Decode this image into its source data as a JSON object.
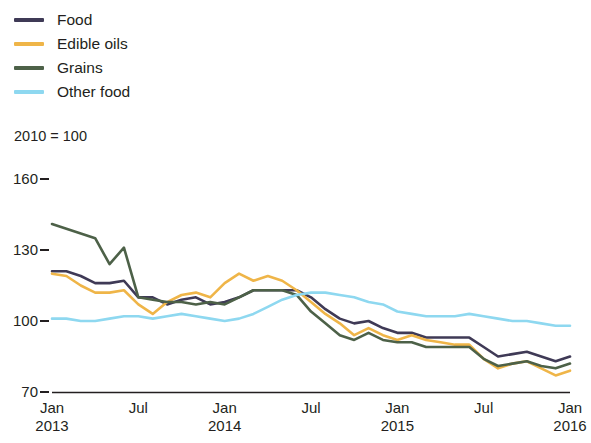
{
  "legend": {
    "items": [
      {
        "label": "Food",
        "color": "#3f3a56",
        "name": "legend-item-food"
      },
      {
        "label": "Edible oils",
        "color": "#efb548",
        "name": "legend-item-edible-oils"
      },
      {
        "label": "Grains",
        "color": "#4d6148",
        "name": "legend-item-grains"
      },
      {
        "label": "Other food",
        "color": "#8ed8f0",
        "name": "legend-item-other-food"
      }
    ]
  },
  "axis_note": "2010 = 100",
  "chart_data": {
    "type": "line",
    "title": "",
    "subtitle": "",
    "xlabel": "",
    "ylabel": "2010 = 100",
    "ylim": [
      70,
      160
    ],
    "yticks": [
      160,
      130,
      100,
      70
    ],
    "grid": false,
    "legend_position": "top-left",
    "x": [
      "Jan 2013",
      "Feb 2013",
      "Mar 2013",
      "Apr 2013",
      "May 2013",
      "Jun 2013",
      "Jul 2013",
      "Aug 2013",
      "Sep 2013",
      "Oct 2013",
      "Nov 2013",
      "Dec 2013",
      "Jan 2014",
      "Feb 2014",
      "Mar 2014",
      "Apr 2014",
      "May 2014",
      "Jun 2014",
      "Jul 2014",
      "Aug 2014",
      "Sep 2014",
      "Oct 2014",
      "Nov 2014",
      "Dec 2014",
      "Jan 2015",
      "Feb 2015",
      "Mar 2015",
      "Apr 2015",
      "May 2015",
      "Jun 2015",
      "Jul 2015",
      "Aug 2015",
      "Sep 2015",
      "Oct 2015",
      "Nov 2015",
      "Dec 2015",
      "Jan 2016"
    ],
    "xticks": [
      {
        "label": "Jan",
        "year": "2013",
        "index": 0
      },
      {
        "label": "Jul",
        "year": "",
        "index": 6
      },
      {
        "label": "Jan",
        "year": "2014",
        "index": 12
      },
      {
        "label": "Jul",
        "year": "",
        "index": 18
      },
      {
        "label": "Jan",
        "year": "2015",
        "index": 24
      },
      {
        "label": "Jul",
        "year": "",
        "index": 30
      },
      {
        "label": "Jan",
        "year": "2016",
        "index": 36
      }
    ],
    "series": [
      {
        "name": "Food",
        "color": "#3f3a56",
        "values": [
          121,
          121,
          119,
          116,
          116,
          117,
          110,
          110,
          107,
          109,
          110,
          107,
          108,
          110,
          113,
          113,
          113,
          113,
          110,
          105,
          101,
          99,
          100,
          97,
          95,
          95,
          93,
          93,
          93,
          93,
          89,
          85,
          86,
          87,
          85,
          83,
          85
        ]
      },
      {
        "name": "Edible oils",
        "color": "#efb548",
        "values": [
          120,
          119,
          115,
          112,
          112,
          113,
          107,
          103,
          108,
          111,
          112,
          110,
          116,
          120,
          117,
          119,
          117,
          113,
          108,
          103,
          99,
          94,
          97,
          94,
          92,
          94,
          92,
          91,
          90,
          90,
          84,
          80,
          82,
          83,
          80,
          77,
          79
        ]
      },
      {
        "name": "Grains",
        "color": "#4d6148",
        "values": [
          141,
          139,
          137,
          135,
          124,
          131,
          110,
          109,
          108,
          108,
          107,
          108,
          107,
          110,
          113,
          113,
          113,
          111,
          104,
          99,
          94,
          92,
          95,
          92,
          91,
          91,
          89,
          89,
          89,
          89,
          84,
          81,
          82,
          83,
          81,
          80,
          82
        ]
      },
      {
        "name": "Other food",
        "color": "#8ed8f0",
        "values": [
          101,
          101,
          100,
          100,
          101,
          102,
          102,
          101,
          102,
          103,
          102,
          101,
          100,
          101,
          103,
          106,
          109,
          111,
          112,
          112,
          111,
          110,
          108,
          107,
          104,
          103,
          102,
          102,
          102,
          103,
          102,
          101,
          100,
          100,
          99,
          98,
          98
        ]
      }
    ]
  },
  "layout": {
    "plot_left": 52,
    "plot_right": 570,
    "y_top_px": 179,
    "y_bottom_px": 392
  }
}
